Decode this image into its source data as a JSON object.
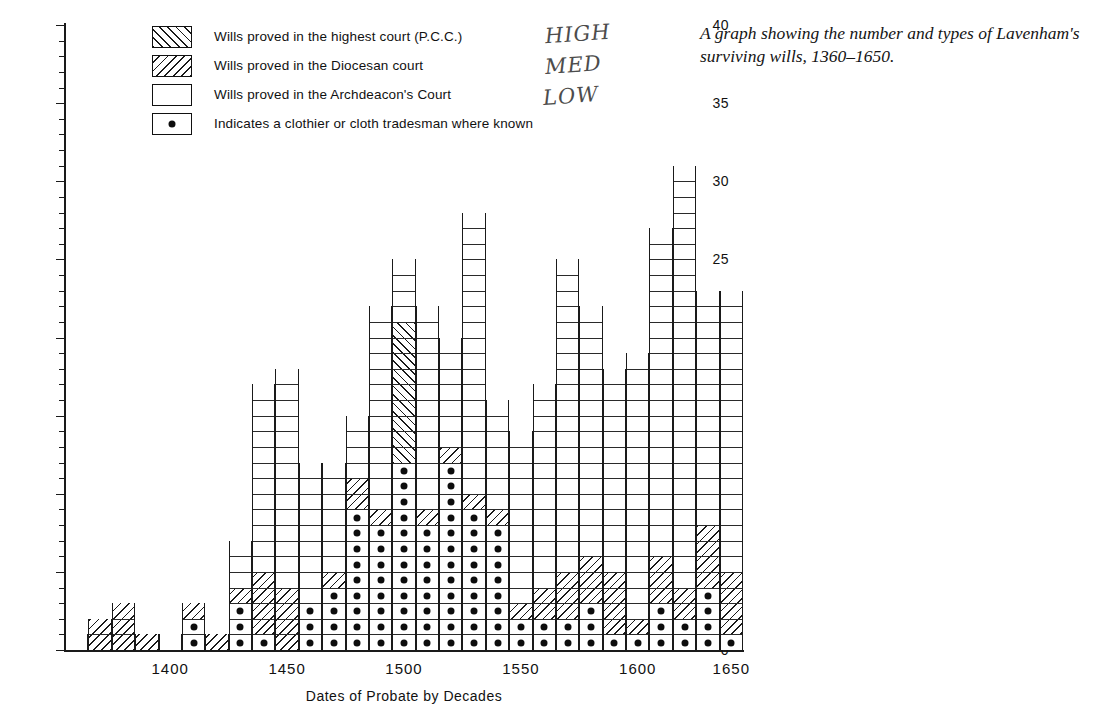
{
  "caption": "A graph showing the number and types of Lavenham's surviving wills, 1360–1650.",
  "legend": {
    "items": [
      {
        "key": "pcc",
        "swatch": "forward-hatch-swatch",
        "label": "Wills proved in the highest court (P.C.C.)"
      },
      {
        "key": "dio",
        "swatch": "backward-hatch-swatch",
        "label": "Wills proved in the Diocesan court"
      },
      {
        "key": "arch",
        "swatch": "blank-swatch",
        "label": "Wills proved in the Archdeacon's Court"
      },
      {
        "key": "dot",
        "swatch": "dot-swatch",
        "label": "Indicates a clothier or cloth tradesman where known"
      }
    ]
  },
  "annotations": [
    {
      "text": "HIGH",
      "x": 545,
      "y": 22
    },
    {
      "text": "MED",
      "x": 545,
      "y": 53
    },
    {
      "text": "LOW",
      "x": 543,
      "y": 84
    }
  ],
  "colors": {
    "ink": "#1a1a1a",
    "paper": "#ffffff",
    "dot": "#0d0d0d"
  },
  "chart_data": {
    "type": "bar",
    "title": "",
    "xlabel": "Dates of Probate  by Decades",
    "ylabel": "Number of Known Wills",
    "ylim": [
      0,
      40
    ],
    "ytick_major": [
      0,
      5,
      10,
      15,
      20,
      25,
      30,
      35,
      40
    ],
    "ytick_minor_step": 1,
    "grid": false,
    "legend_position": "top-left",
    "stacked": true,
    "stack_order": [
      "archdeacon",
      "diocesan",
      "pcc"
    ],
    "series": [
      {
        "name": "Wills proved in the Archdeacon's Court",
        "key": "arch"
      },
      {
        "name": "Wills proved in the Diocesan court",
        "key": "dio"
      },
      {
        "name": "Wills proved in the highest court (P.C.C.)",
        "key": "pcc"
      }
    ],
    "xtick_labels": [
      "1400",
      "1450",
      "1500",
      "1550",
      "1600",
      "1650"
    ],
    "xtick_decades": [
      1400,
      1450,
      1500,
      1550,
      1600,
      1650
    ],
    "categories": [
      "1360",
      "1370",
      "1380",
      "1390",
      "1400",
      "1410",
      "1420",
      "1430",
      "1440",
      "1450",
      "1460",
      "1470",
      "1480",
      "1490",
      "1500",
      "1510",
      "1520",
      "1530",
      "1540",
      "1550",
      "1560",
      "1570",
      "1580",
      "1590",
      "1600",
      "1610",
      "1620",
      "1630",
      "1640"
    ],
    "totals": [
      1,
      2,
      3,
      1,
      1,
      3,
      1,
      7,
      17,
      18,
      12,
      12,
      15,
      22,
      25,
      22,
      20,
      28,
      16,
      14,
      17,
      25,
      22,
      18,
      19,
      27,
      31,
      23,
      23
    ],
    "bars": [
      {
        "decade": "1360",
        "total": 1,
        "pcc": 0,
        "dio": 0,
        "arch": 1,
        "dots": 0
      },
      {
        "decade": "1370",
        "total": 2,
        "pcc": 0,
        "dio": 2,
        "arch": 0,
        "dots": 0
      },
      {
        "decade": "1380",
        "total": 3,
        "pcc": 0,
        "dio": 3,
        "arch": 0,
        "dots": 0
      },
      {
        "decade": "1390",
        "total": 1,
        "pcc": 0,
        "dio": 1,
        "arch": 0,
        "dots": 0
      },
      {
        "decade": "1400",
        "total": 1,
        "pcc": 0,
        "dio": 0,
        "arch": 1,
        "dots": 0
      },
      {
        "decade": "1410",
        "total": 3,
        "pcc": 0,
        "dio": 3,
        "arch": 0,
        "dots": 2
      },
      {
        "decade": "1420",
        "total": 1,
        "pcc": 0,
        "dio": 1,
        "arch": 0,
        "dots": 0
      },
      {
        "decade": "1430",
        "total": 7,
        "pcc": 0,
        "dio": 4,
        "arch": 3,
        "dots": 3
      },
      {
        "decade": "1440",
        "total": 17,
        "pcc": 0,
        "dio": 5,
        "arch": 12,
        "dots": 1
      },
      {
        "decade": "1450",
        "total": 18,
        "pcc": 0,
        "dio": 4,
        "arch": 14,
        "dots": 0
      },
      {
        "decade": "1460",
        "total": 12,
        "pcc": 0,
        "dio": 2,
        "arch": 10,
        "dots": 3
      },
      {
        "decade": "1470",
        "total": 12,
        "pcc": 0,
        "dio": 5,
        "arch": 7,
        "dots": 4
      },
      {
        "decade": "1480",
        "total": 15,
        "pcc": 0,
        "dio": 11,
        "arch": 4,
        "dots": 9
      },
      {
        "decade": "1490",
        "total": 22,
        "pcc": 0,
        "dio": 9,
        "arch": 13,
        "dots": 8
      },
      {
        "decade": "1500",
        "total": 25,
        "pcc": 21,
        "dio": 0,
        "arch": 4,
        "dots": 12
      },
      {
        "decade": "1510",
        "total": 22,
        "pcc": 0,
        "dio": 9,
        "arch": 13,
        "dots": 8
      },
      {
        "decade": "1520",
        "total": 20,
        "pcc": 0,
        "dio": 13,
        "arch": 7,
        "dots": 12
      },
      {
        "decade": "1530",
        "total": 28,
        "pcc": 0,
        "dio": 10,
        "arch": 18,
        "dots": 9
      },
      {
        "decade": "1540",
        "total": 16,
        "pcc": 0,
        "dio": 9,
        "arch": 7,
        "dots": 8
      },
      {
        "decade": "1550",
        "total": 14,
        "pcc": 0,
        "dio": 3,
        "arch": 11,
        "dots": 2
      },
      {
        "decade": "1560",
        "total": 17,
        "pcc": 0,
        "dio": 4,
        "arch": 13,
        "dots": 2
      },
      {
        "decade": "1570",
        "total": 25,
        "pcc": 0,
        "dio": 5,
        "arch": 20,
        "dots": 2
      },
      {
        "decade": "1580",
        "total": 22,
        "pcc": 0,
        "dio": 6,
        "arch": 16,
        "dots": 3
      },
      {
        "decade": "1590",
        "total": 18,
        "pcc": 0,
        "dio": 5,
        "arch": 13,
        "dots": 1
      },
      {
        "decade": "1600",
        "total": 19,
        "pcc": 0,
        "dio": 2,
        "arch": 17,
        "dots": 1
      },
      {
        "decade": "1610",
        "total": 27,
        "pcc": 0,
        "dio": 6,
        "arch": 21,
        "dots": 3
      },
      {
        "decade": "1620",
        "total": 31,
        "pcc": 0,
        "dio": 4,
        "arch": 27,
        "dots": 2
      },
      {
        "decade": "1630",
        "total": 23,
        "pcc": 0,
        "dio": 8,
        "arch": 15,
        "dots": 4
      },
      {
        "decade": "1640",
        "total": 23,
        "pcc": 0,
        "dio": 5,
        "arch": 18,
        "dots": 1
      }
    ]
  }
}
